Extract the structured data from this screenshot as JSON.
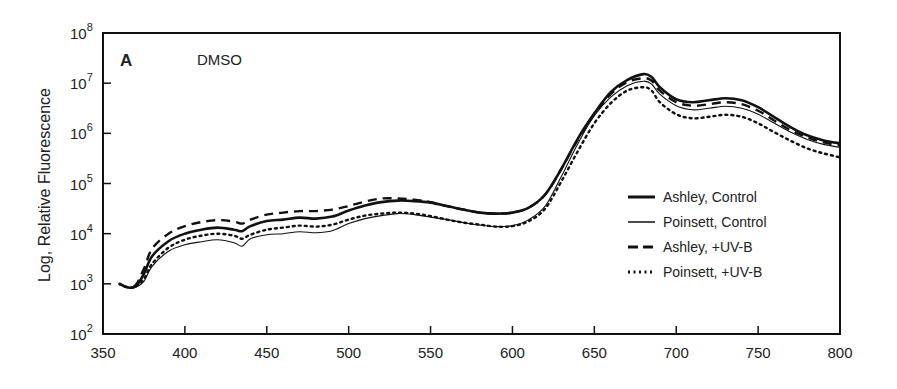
{
  "chart_data": {
    "type": "line",
    "panel_label": "A",
    "title": "DMSO",
    "xlabel": "",
    "ylabel": "Log, Relative Fluorescence",
    "xlim": [
      350,
      800
    ],
    "ylim": [
      100,
      100000000
    ],
    "yscale": "log",
    "grid": false,
    "legend_position": "lower right (inside)",
    "x_ticks": [
      350,
      400,
      450,
      500,
      550,
      600,
      650,
      700,
      750,
      800
    ],
    "y_ticks": [
      {
        "base": "10",
        "exp": "2"
      },
      {
        "base": "10",
        "exp": "3"
      },
      {
        "base": "10",
        "exp": "4"
      },
      {
        "base": "10",
        "exp": "5"
      },
      {
        "base": "10",
        "exp": "6"
      },
      {
        "base": "10",
        "exp": "7"
      },
      {
        "base": "10",
        "exp": "8"
      }
    ],
    "x": [
      360,
      365,
      370,
      375,
      380,
      390,
      400,
      410,
      420,
      430,
      435,
      440,
      450,
      460,
      470,
      480,
      490,
      500,
      510,
      520,
      530,
      540,
      550,
      560,
      570,
      580,
      590,
      600,
      610,
      620,
      630,
      640,
      650,
      660,
      670,
      680,
      685,
      690,
      700,
      710,
      720,
      730,
      740,
      750,
      760,
      770,
      780,
      790,
      800
    ],
    "series": [
      {
        "name": "Ashley, Control",
        "style": "thick-solid",
        "log10_values": [
          3.0,
          2.93,
          2.95,
          3.2,
          3.55,
          3.85,
          4.0,
          4.08,
          4.12,
          4.08,
          4.05,
          4.15,
          4.25,
          4.28,
          4.32,
          4.3,
          4.34,
          4.46,
          4.56,
          4.63,
          4.66,
          4.65,
          4.62,
          4.55,
          4.48,
          4.42,
          4.4,
          4.42,
          4.52,
          4.78,
          5.3,
          5.9,
          6.4,
          6.82,
          7.06,
          7.18,
          7.12,
          6.92,
          6.68,
          6.62,
          6.66,
          6.7,
          6.66,
          6.52,
          6.32,
          6.12,
          5.96,
          5.86,
          5.8
        ]
      },
      {
        "name": "Poinsett, Control",
        "style": "thin-solid",
        "log10_values": [
          3.0,
          2.93,
          2.93,
          3.05,
          3.35,
          3.65,
          3.78,
          3.84,
          3.88,
          3.82,
          3.75,
          3.9,
          3.98,
          4.0,
          4.04,
          4.02,
          4.06,
          4.2,
          4.3,
          4.36,
          4.4,
          4.38,
          4.33,
          4.28,
          4.22,
          4.17,
          4.14,
          4.16,
          4.28,
          4.55,
          5.15,
          5.8,
          6.35,
          6.72,
          6.95,
          7.04,
          6.98,
          6.78,
          6.55,
          6.47,
          6.5,
          6.54,
          6.5,
          6.38,
          6.2,
          6.02,
          5.88,
          5.78,
          5.72
        ]
      },
      {
        "name": "Ashley, +UV-B",
        "style": "dashed",
        "log10_values": [
          3.0,
          2.93,
          2.98,
          3.3,
          3.7,
          4.0,
          4.15,
          4.23,
          4.27,
          4.24,
          4.2,
          4.28,
          4.38,
          4.42,
          4.45,
          4.45,
          4.48,
          4.55,
          4.64,
          4.7,
          4.7,
          4.68,
          4.63,
          4.55,
          4.48,
          4.42,
          4.4,
          4.42,
          4.52,
          4.78,
          5.3,
          5.88,
          6.38,
          6.78,
          7.02,
          7.1,
          7.05,
          6.85,
          6.62,
          6.55,
          6.58,
          6.62,
          6.58,
          6.45,
          6.25,
          6.06,
          5.92,
          5.82,
          5.76
        ]
      },
      {
        "name": "Poinsett, +UV-B",
        "style": "dotted",
        "log10_values": [
          3.0,
          2.93,
          2.95,
          3.1,
          3.4,
          3.72,
          3.88,
          3.96,
          4.0,
          3.96,
          3.9,
          3.98,
          4.08,
          4.12,
          4.16,
          4.14,
          4.18,
          4.28,
          4.36,
          4.4,
          4.42,
          4.4,
          4.35,
          4.28,
          4.22,
          4.18,
          4.14,
          4.15,
          4.25,
          4.5,
          5.05,
          5.65,
          6.2,
          6.6,
          6.85,
          6.92,
          6.85,
          6.62,
          6.38,
          6.3,
          6.33,
          6.37,
          6.33,
          6.2,
          6.02,
          5.85,
          5.7,
          5.6,
          5.52
        ]
      }
    ]
  },
  "colors": {
    "line": "#111111",
    "axis": "#111111",
    "text": "#222222",
    "background": "#ffffff"
  }
}
